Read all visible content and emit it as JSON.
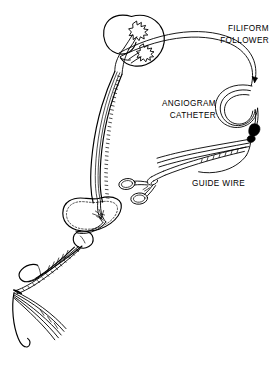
{
  "figure": {
    "background_color": "#ffffff",
    "ink_color": "#000000",
    "width": 274,
    "height": 368
  },
  "labels": [
    {
      "id": "filiform-follower",
      "line1": "FILIFORM",
      "line2": "FOLLOWER",
      "align": "right"
    },
    {
      "id": "angiogram-catheter",
      "line1": "ANGIOGRAM",
      "line2": "CATHETER",
      "align": "right"
    },
    {
      "id": "guide-wire",
      "line1": "GUIDE  WIRE",
      "line2": "",
      "align": "left"
    }
  ],
  "anatomy": [
    {
      "id": "kidney",
      "name": "kidney"
    },
    {
      "id": "renal-calyces",
      "name": "renal calyces"
    },
    {
      "id": "renal-pelvis",
      "name": "renal pelvis"
    },
    {
      "id": "ureter",
      "name": "ureter"
    },
    {
      "id": "bladder",
      "name": "urinary bladder"
    },
    {
      "id": "ureteral-orifice",
      "name": "ureteral orifice"
    },
    {
      "id": "prostate",
      "name": "prostate"
    },
    {
      "id": "penis",
      "name": "penis"
    },
    {
      "id": "urethral-meatus",
      "name": "urethral meatus"
    }
  ],
  "instruments": [
    {
      "id": "filiform-follower-catheter",
      "name": "filiform follower catheter"
    },
    {
      "id": "angiogram-catheter-coil",
      "name": "coiled angiogram catheter"
    },
    {
      "id": "catheter-hub",
      "name": "catheter hub connector"
    },
    {
      "id": "hemostat-clamp",
      "name": "hemostat clamp"
    },
    {
      "id": "guide-wire-strands",
      "name": "guide wire strands"
    }
  ]
}
